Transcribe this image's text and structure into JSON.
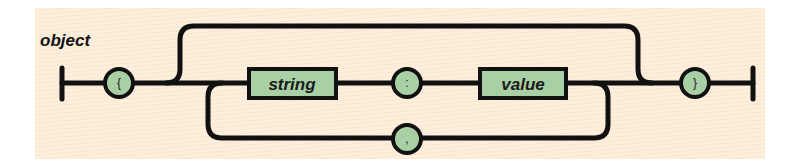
{
  "diagram": {
    "title": "object",
    "type": "railroad-syntax-diagram",
    "nodes": {
      "open_brace": {
        "label": "{",
        "kind": "terminal-circle"
      },
      "string": {
        "label": "string",
        "kind": "nonterminal-box"
      },
      "colon": {
        "label": ":",
        "kind": "terminal-circle"
      },
      "value": {
        "label": "value",
        "kind": "nonterminal-box"
      },
      "comma": {
        "label": ",",
        "kind": "terminal-circle"
      },
      "close_brace": {
        "label": "}",
        "kind": "terminal-circle"
      }
    },
    "edges": [
      {
        "from": "start",
        "to": "open_brace"
      },
      {
        "from": "open_brace",
        "to": "string"
      },
      {
        "from": "open_brace",
        "to": "close_brace",
        "via": "empty-bypass"
      },
      {
        "from": "string",
        "to": "colon"
      },
      {
        "from": "colon",
        "to": "value"
      },
      {
        "from": "value",
        "to": "comma",
        "via": "loop-back"
      },
      {
        "from": "comma",
        "to": "string",
        "via": "loop-back"
      },
      {
        "from": "value",
        "to": "close_brace"
      },
      {
        "from": "close_brace",
        "to": "end"
      }
    ],
    "colors": {
      "background": "#fdefdc",
      "node_fill": "#a9cfa4",
      "line": "#111111"
    }
  }
}
